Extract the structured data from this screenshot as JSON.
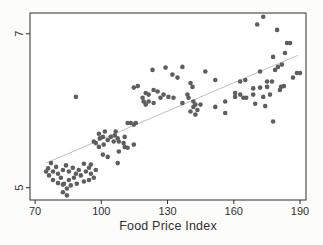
{
  "chart_data": {
    "type": "scatter",
    "title": "",
    "xlabel": "Food Price Index",
    "ylabel": "",
    "xlim": [
      67.7,
      192.7
    ],
    "ylim": [
      4.84,
      7.27
    ],
    "x_ticks": [
      70,
      100,
      130,
      160,
      190
    ],
    "y_ticks": [
      5,
      7
    ],
    "grid": false,
    "legend": false,
    "colors": {
      "dot": "#5e5e5e",
      "fit_line": "#b8b8b8",
      "frame": "#2e2e2e",
      "text": "#303030",
      "plot_bg": "#ffffff",
      "page_bg": "#fcfcfa"
    },
    "series": [
      {
        "name": "observations",
        "type": "scatter",
        "points": [
          [
            77.2,
            5.32
          ],
          [
            79.5,
            5.27
          ],
          [
            75.9,
            5.25
          ],
          [
            78.1,
            5.21
          ],
          [
            80.4,
            5.18
          ],
          [
            82.6,
            5.23
          ],
          [
            84.0,
            5.29
          ],
          [
            85.3,
            5.21
          ],
          [
            87.1,
            5.26
          ],
          [
            88.5,
            5.18
          ],
          [
            89.8,
            5.23
          ],
          [
            81.7,
            5.13
          ],
          [
            78.1,
            5.1
          ],
          [
            76.3,
            5.16
          ],
          [
            85.3,
            5.1
          ],
          [
            87.6,
            5.13
          ],
          [
            90.7,
            5.16
          ],
          [
            93.0,
            5.21
          ],
          [
            94.4,
            5.26
          ],
          [
            92.1,
            5.31
          ],
          [
            95.3,
            5.18
          ],
          [
            96.6,
            5.13
          ],
          [
            82.6,
            5.04
          ],
          [
            80.4,
            5.06
          ],
          [
            86.2,
            5.03
          ],
          [
            88.9,
            5.05
          ],
          [
            83.1,
            5.05
          ],
          [
            84.4,
            4.99
          ],
          [
            82.6,
            4.94
          ],
          [
            84.4,
            4.9
          ],
          [
            92.1,
            5.08
          ],
          [
            94.4,
            5.1
          ],
          [
            97.5,
            5.23
          ],
          [
            95.3,
            5.3
          ],
          [
            75.0,
            5.21
          ],
          [
            98.9,
            5.7
          ],
          [
            101.6,
            5.73
          ],
          [
            106.1,
            5.68
          ],
          [
            107.4,
            5.64
          ],
          [
            110.6,
            5.66
          ],
          [
            102.9,
            5.62
          ],
          [
            99.3,
            5.64
          ],
          [
            96.6,
            5.6
          ],
          [
            97.5,
            5.58
          ],
          [
            100.7,
            5.66
          ],
          [
            104.3,
            5.66
          ],
          [
            105.6,
            5.6
          ],
          [
            107.9,
            5.6
          ],
          [
            110.1,
            5.58
          ],
          [
            101.1,
            5.56
          ],
          [
            98.9,
            5.53
          ],
          [
            100.7,
            5.43
          ],
          [
            102.9,
            5.4
          ],
          [
            107.9,
            5.47
          ],
          [
            107.4,
            5.32
          ],
          [
            111.9,
            5.52
          ],
          [
            114.7,
            5.56
          ],
          [
            106.5,
            5.73
          ],
          [
            111.9,
            5.84
          ],
          [
            113.3,
            5.84
          ],
          [
            114.7,
            5.82
          ],
          [
            115.6,
            5.84
          ],
          [
            110.6,
            5.53
          ],
          [
            88.5,
            6.18
          ],
          [
            123.2,
            6.53
          ],
          [
            129.1,
            6.56
          ],
          [
            136.7,
            6.57
          ],
          [
            132.2,
            6.47
          ],
          [
            134.5,
            6.43
          ],
          [
            140.4,
            6.36
          ],
          [
            141.3,
            6.31
          ],
          [
            114.7,
            6.3
          ],
          [
            116.5,
            6.32
          ],
          [
            120.1,
            6.23
          ],
          [
            121.4,
            6.21
          ],
          [
            123.7,
            6.27
          ],
          [
            125.5,
            6.25
          ],
          [
            128.2,
            6.21
          ],
          [
            130.4,
            6.18
          ],
          [
            132.7,
            6.17
          ],
          [
            126.8,
            6.17
          ],
          [
            118.7,
            6.17
          ],
          [
            119.2,
            6.12
          ],
          [
            121.4,
            6.12
          ],
          [
            123.7,
            6.1
          ],
          [
            139.0,
            6.21
          ],
          [
            139.5,
            6.17
          ],
          [
            141.7,
            6.12
          ],
          [
            142.6,
            6.08
          ],
          [
            120.1,
            6.08
          ],
          [
            136.7,
            6.1
          ],
          [
            147.1,
            6.51
          ],
          [
            151.6,
            6.4
          ],
          [
            140.4,
            5.99
          ],
          [
            141.7,
            6.05
          ],
          [
            143.5,
            6.01
          ],
          [
            142.6,
            5.95
          ],
          [
            144.9,
            6.08
          ],
          [
            151.6,
            6.05
          ],
          [
            156.1,
            6.12
          ],
          [
            156.1,
            5.97
          ],
          [
            160.6,
            6.18
          ],
          [
            162.9,
            6.21
          ],
          [
            164.3,
            6.17
          ],
          [
            173.3,
            7.22
          ],
          [
            170.6,
            7.12
          ],
          [
            179.6,
            7.05
          ],
          [
            184.1,
            6.88
          ],
          [
            185.5,
            6.88
          ],
          [
            183.2,
            6.75
          ],
          [
            177.8,
            6.7
          ],
          [
            181.8,
            6.6
          ],
          [
            180.0,
            6.57
          ],
          [
            171.9,
            6.51
          ],
          [
            178.7,
            6.53
          ],
          [
            165.2,
            6.4
          ],
          [
            162.9,
            6.38
          ],
          [
            175.1,
            6.38
          ],
          [
            177.3,
            6.38
          ],
          [
            188.6,
            6.49
          ],
          [
            190.0,
            6.49
          ],
          [
            186.8,
            6.43
          ],
          [
            168.8,
            6.29
          ],
          [
            171.9,
            6.3
          ],
          [
            175.1,
            6.31
          ],
          [
            181.4,
            6.31
          ],
          [
            182.7,
            6.32
          ],
          [
            160.6,
            6.23
          ],
          [
            165.6,
            6.17
          ],
          [
            168.8,
            6.21
          ],
          [
            173.3,
            6.18
          ],
          [
            176.4,
            6.21
          ],
          [
            180.9,
            6.27
          ],
          [
            169.7,
            6.09
          ],
          [
            174.2,
            6.06
          ],
          [
            177.8,
            5.86
          ]
        ]
      },
      {
        "name": "linear-fit",
        "type": "line",
        "points": [
          [
            75,
            5.32
          ],
          [
            189,
            6.72
          ]
        ]
      }
    ]
  }
}
